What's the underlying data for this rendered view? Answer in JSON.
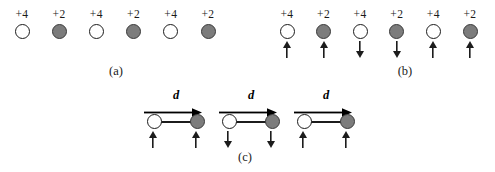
{
  "figure": {
    "background_color": "#ffffff",
    "ink_color": "#1c1c1c",
    "open_circle_color": "#ffffff",
    "filled_circle_color": "#7c7c7c",
    "panels": [
      {
        "id": "a",
        "caption": "(a)",
        "has_spin_arrows": false,
        "charges": [
          {
            "label": "+4",
            "fill": "open",
            "spin": "none"
          },
          {
            "label": "+2",
            "fill": "filled",
            "spin": "none"
          },
          {
            "label": "+4",
            "fill": "open",
            "spin": "none"
          },
          {
            "label": "+2",
            "fill": "filled",
            "spin": "none"
          },
          {
            "label": "+4",
            "fill": "open",
            "spin": "none"
          },
          {
            "label": "+2",
            "fill": "filled",
            "spin": "none"
          }
        ]
      },
      {
        "id": "b",
        "caption": "(b)",
        "has_spin_arrows": true,
        "charges": [
          {
            "label": "+4",
            "fill": "open",
            "spin": "up"
          },
          {
            "label": "+2",
            "fill": "filled",
            "spin": "up"
          },
          {
            "label": "+4",
            "fill": "open",
            "spin": "down"
          },
          {
            "label": "+2",
            "fill": "filled",
            "spin": "down"
          },
          {
            "label": "+4",
            "fill": "open",
            "spin": "up"
          },
          {
            "label": "+2",
            "fill": "filled",
            "spin": "up"
          }
        ]
      },
      {
        "id": "c",
        "caption": "(c)",
        "separation_label": "d",
        "dipoles": [
          {
            "left_fill": "open",
            "right_fill": "filled",
            "left_spin": "up",
            "right_spin": "up"
          },
          {
            "left_fill": "open",
            "right_fill": "filled",
            "left_spin": "down",
            "right_spin": "down"
          },
          {
            "left_fill": "open",
            "right_fill": "filled",
            "left_spin": "up",
            "right_spin": "up"
          }
        ]
      }
    ]
  }
}
